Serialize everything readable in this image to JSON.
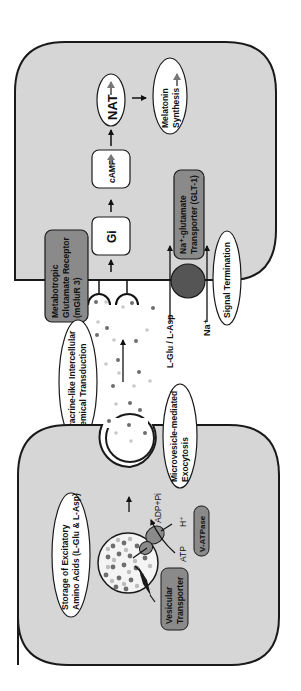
{
  "diagram": {
    "orientation": "rotated-90-ccw",
    "colors": {
      "cell_fill": "#d6d6d6",
      "cell_stroke": "#1a1a1a",
      "box_dark": "#8a8a8a",
      "box_white": "#ffffff",
      "transporter_ball": "#555555",
      "droplet_dark": "#6e6e6e",
      "droplet_light": "#c8c8c8",
      "background": "#ffffff"
    },
    "postsynaptic_cell": {
      "nodes": {
        "gi": "Gi",
        "camp": "cAMP",
        "nat": "NAT",
        "melatonin_line1": "Melatonin",
        "melatonin_line2": "Synthesis"
      },
      "receptor": {
        "line1": "Metabotropic",
        "line2": "Glutamate Receptor",
        "line3": "(mGluR 3)"
      },
      "transporter": {
        "line1": "Na⁺-glutamate",
        "line2": "Transporter (GLT-1)"
      },
      "signal_termination": "Signal Termination",
      "transporter_inputs": {
        "substrate": "L-Glu / L-Asp",
        "ion": "Na⁺"
      }
    },
    "extracellular": {
      "paracrine_line1": "Paracrine-like Intercellular",
      "paracrine_line2": "Chemical Transduction",
      "exocytosis_line1": "Microvesicle-mediated",
      "exocytosis_line2": "Exocytosis"
    },
    "presynaptic_cell": {
      "storage_line1": "Storage of Excitatory",
      "storage_line2": "Amino Acids (L-Glu & L-Asp)",
      "vesicular_line1": "Vesicular",
      "vesicular_line2": "Transporter",
      "v_atpase": "V-ATPase",
      "atp": "ATP",
      "adp": "ADP+Pi",
      "h_plus": "H⁺"
    }
  }
}
